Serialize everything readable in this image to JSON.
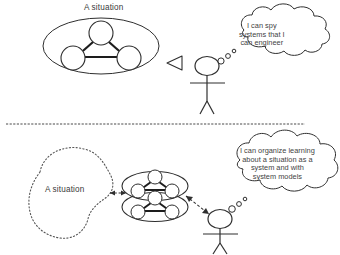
{
  "figure": {
    "type": "conceptual-diagram",
    "panels": [
      {
        "id": "top",
        "situation_label": "A situation",
        "thought_lines": [
          "I can spy",
          "systems that I",
          "can engineer"
        ],
        "thought_text": "I can spy systems that I can engineer"
      },
      {
        "id": "bottom",
        "situation_label": "A situation",
        "thought_lines": [
          "I can organize learning",
          "about a situation as a",
          "system and with",
          "system models"
        ],
        "thought_text": "I can organize learning about a situation as a system and with system models"
      }
    ]
  },
  "colors": {
    "ink": "#3a3a3a",
    "stroke": "#2f2f2f",
    "background": "#ffffff",
    "dotted": "#555555"
  }
}
